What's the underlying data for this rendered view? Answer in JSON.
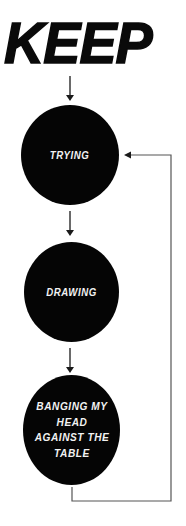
{
  "title": "KEEP",
  "nodes": [
    {
      "label": "TRYING"
    },
    {
      "label": "DRAWING"
    },
    {
      "label": "BANGING MY HEAD AGAINST THE TABLE"
    }
  ],
  "colors": {
    "node_fill": "#050505",
    "node_text": "#f2f2f2",
    "title": "#0a0a0a",
    "arrow": "#1a1a1a",
    "loop_line": "#555555",
    "background": "#ffffff"
  },
  "edges": [
    {
      "from": "KEEP",
      "to": "TRYING"
    },
    {
      "from": "TRYING",
      "to": "DRAWING"
    },
    {
      "from": "DRAWING",
      "to": "BANGING MY HEAD AGAINST THE TABLE"
    },
    {
      "from": "BANGING MY HEAD AGAINST THE TABLE",
      "to": "TRYING",
      "type": "loop-back"
    }
  ]
}
